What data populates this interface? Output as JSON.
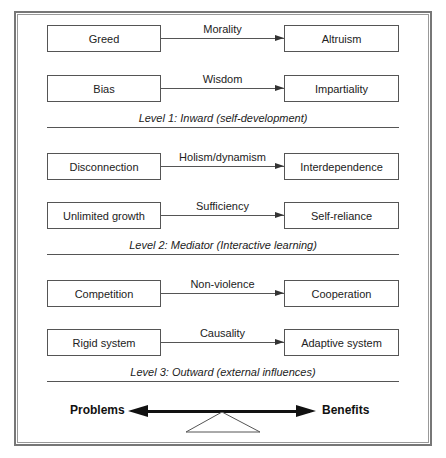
{
  "diagram": {
    "levels": [
      {
        "caption": "Level 1: Inward (self-development)",
        "rows": [
          {
            "from": "Greed",
            "via": "Morality",
            "to": "Altruism"
          },
          {
            "from": "Bias",
            "via": "Wisdom",
            "to": "Impartiality"
          }
        ]
      },
      {
        "caption": "Level 2: Mediator (Interactive learning)",
        "rows": [
          {
            "from": "Disconnection",
            "via": "Holism/dynamism",
            "to": "Interdependence"
          },
          {
            "from": "Unlimited growth",
            "via": "Sufficiency",
            "to": "Self-reliance"
          }
        ]
      },
      {
        "caption": "Level 3: Outward (external influences)",
        "rows": [
          {
            "from": "Competition",
            "via": "Non-violence",
            "to": "Cooperation"
          },
          {
            "from": "Rigid system",
            "via": "Causality",
            "to": "Adaptive system"
          }
        ]
      }
    ],
    "balance": {
      "left_label": "Problems",
      "right_label": "Benefits"
    }
  }
}
